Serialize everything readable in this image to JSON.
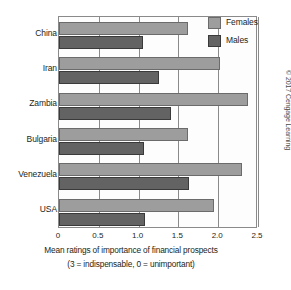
{
  "chart_data": {
    "type": "bar",
    "orientation": "horizontal",
    "title": "",
    "xlabel": "Mean ratings of importance of financial prospects",
    "xlabel_note": "(3 = indispensable, 0 = unimportant)",
    "ylabel": "",
    "categories": [
      "China",
      "Iran",
      "Zambia",
      "Bulgaria",
      "Venezuela",
      "USA"
    ],
    "series": [
      {
        "name": "Females",
        "color": "#9d9d9d",
        "values": [
          1.62,
          2.02,
          2.37,
          1.62,
          2.3,
          1.95
        ]
      },
      {
        "name": "Males",
        "color": "#636363",
        "values": [
          1.05,
          1.25,
          1.41,
          1.07,
          1.63,
          1.08
        ]
      }
    ],
    "xlim": [
      0,
      2.5
    ],
    "xticks": [
      0,
      0.5,
      1.0,
      1.5,
      2.0,
      2.5
    ],
    "xtick_labels": [
      "0",
      "0.5",
      "1.0",
      "1.5",
      "2.0",
      "2.5"
    ],
    "grid": true,
    "grid_axis": "x",
    "legend_position": "top-right"
  },
  "legend": {
    "items": [
      {
        "label": "Females"
      },
      {
        "label": "Males"
      }
    ]
  },
  "credit": {
    "text": "© 2017 Cengage Learning"
  }
}
